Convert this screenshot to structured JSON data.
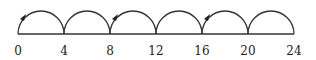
{
  "diagram": {
    "type": "number-line-jumps",
    "ticks": [
      "0",
      "4",
      "8",
      "12",
      "16",
      "20",
      "24"
    ],
    "jump_size": 4,
    "arrow_arcs": [
      0,
      2,
      4
    ],
    "line_color": "#333333"
  }
}
